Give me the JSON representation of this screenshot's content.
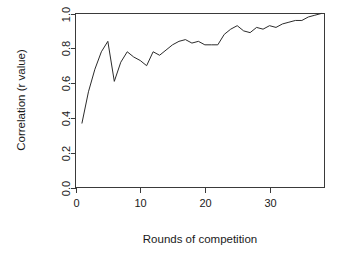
{
  "chart_data": {
    "type": "line",
    "title": "",
    "xlabel": "Rounds of competition",
    "ylabel": "Correlation (r value)",
    "xlim": [
      0,
      38.5
    ],
    "ylim": [
      0.0,
      1.0
    ],
    "xticks": [
      0,
      10,
      20,
      30
    ],
    "xtick_labels": [
      "0",
      "10",
      "20",
      "30"
    ],
    "yticks": [
      0.0,
      0.2,
      0.4,
      0.6,
      0.8,
      1.0
    ],
    "ytick_labels": [
      "0.0",
      "0.2",
      "0.4",
      "0.6",
      "0.8",
      "1.0"
    ],
    "grid": false,
    "legend": false,
    "legend_position": "none",
    "line_color": "#2b2b2b",
    "axis_color": "#3a3a3a",
    "background_color": "#ffffff",
    "box_frame": true,
    "series": [
      {
        "name": "Correlation (r value)",
        "x": [
          1,
          2,
          3,
          4,
          5,
          6,
          7,
          8,
          9,
          10,
          11,
          12,
          13,
          14,
          15,
          16,
          17,
          18,
          19,
          20,
          21,
          22,
          23,
          24,
          25,
          26,
          27,
          28,
          29,
          30,
          31,
          32,
          33,
          34,
          35,
          36,
          37,
          38
        ],
        "values": [
          0.37,
          0.55,
          0.68,
          0.78,
          0.84,
          0.61,
          0.72,
          0.78,
          0.75,
          0.73,
          0.7,
          0.78,
          0.76,
          0.79,
          0.82,
          0.84,
          0.85,
          0.83,
          0.84,
          0.82,
          0.82,
          0.82,
          0.88,
          0.91,
          0.93,
          0.9,
          0.89,
          0.92,
          0.91,
          0.93,
          0.92,
          0.94,
          0.95,
          0.96,
          0.96,
          0.98,
          0.99,
          1.0
        ]
      }
    ],
    "annotations": []
  },
  "labels": {
    "x_axis_title": "Rounds of competition",
    "y_axis_title": "Correlation (r value)"
  }
}
